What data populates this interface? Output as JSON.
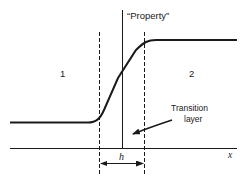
{
  "diagram": {
    "title_label": "“Property”",
    "region_left_label": "1",
    "region_right_label": "2",
    "transition_label_line1": "Transition",
    "transition_label_line2": "layer",
    "width_label": "h",
    "x_axis_label": "x"
  },
  "colors": {
    "ink": "#1a1a1a",
    "background": "#ffffff"
  }
}
